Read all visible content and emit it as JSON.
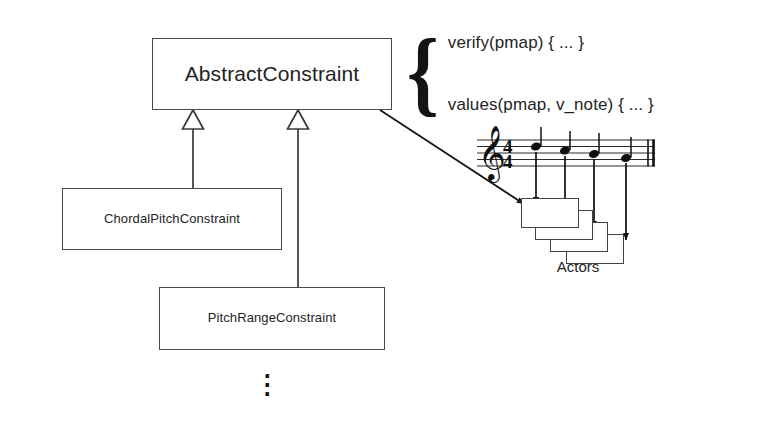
{
  "diagram": {
    "stroke_color": "#444444",
    "text_color": "#242424",
    "background_color": "#ffffff"
  },
  "classes": {
    "superclass": {
      "name": "AbstractConstraint"
    },
    "subclasses": [
      {
        "name": "ChordalPitchConstraint"
      },
      {
        "name": "PitchRangeConstraint"
      }
    ],
    "more_indicator": "⋮"
  },
  "methods": {
    "brace": "{",
    "items": [
      "verify(pmap) { ... }",
      "values(pmap, v_note) { ... }"
    ]
  },
  "actors": {
    "caption": "Actors",
    "box_count": 4
  },
  "score": {
    "clef": "treble-clef",
    "time_signature": "4/4",
    "time_signature_numerator": "4",
    "time_signature_denominator": "4",
    "note_count": 4,
    "barline": "double-barline"
  },
  "relationships": {
    "generalization_count": 2,
    "association_label": "",
    "note_to_actor_arrow_count": 4
  }
}
